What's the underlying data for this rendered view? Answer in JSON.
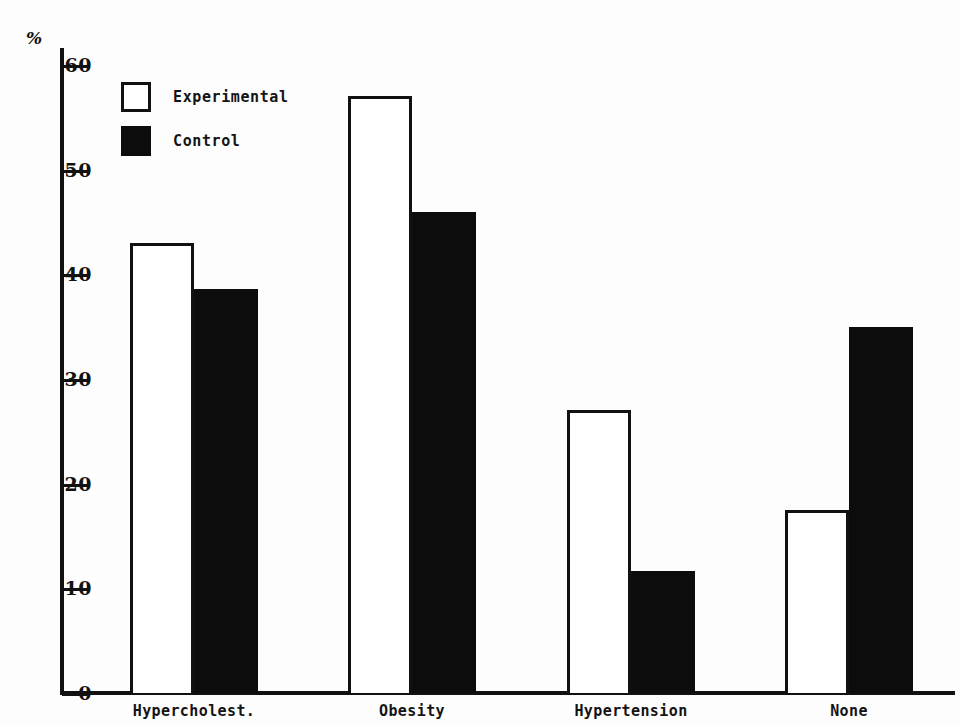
{
  "chart_data": {
    "type": "bar",
    "title": "",
    "xlabel": "",
    "ylabel": "%",
    "ylim": [
      0,
      60
    ],
    "ytick_labels": [
      "0",
      "10",
      "20",
      "30",
      "40",
      "50",
      "60"
    ],
    "ytick_values": [
      0,
      10,
      20,
      30,
      40,
      50,
      60
    ],
    "grid": false,
    "legend_position": "top-left",
    "categories": [
      "Hypercholest.",
      "Obesity",
      "Hypertension",
      "None"
    ],
    "series": [
      {
        "name": "Experimental",
        "color": "#ffffff",
        "edge_color": "#111111",
        "values": [
          43,
          57,
          27,
          17.5
        ]
      },
      {
        "name": "Control",
        "color": "#0c0c0c",
        "edge_color": "#0c0c0c",
        "values": [
          38.6,
          46,
          11.7,
          35
        ]
      }
    ]
  },
  "axis": {
    "unit_symbol": "%"
  },
  "legend": {
    "entries": [
      {
        "label": "Experimental",
        "swatch": "white-square-outline"
      },
      {
        "label": "Control",
        "swatch": "black-filled-square"
      }
    ]
  }
}
